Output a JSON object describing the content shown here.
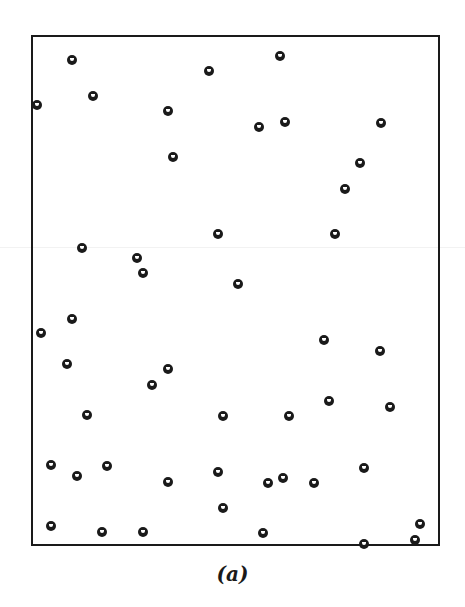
{
  "figure": {
    "caption": "(a)",
    "frame": {
      "left": 31,
      "top": 35,
      "right": 438,
      "bottom": 544
    },
    "point_style": "black ring with white crescent"
  },
  "chart_data": {
    "type": "scatter",
    "title": "",
    "caption": "(a)",
    "xlabel": "",
    "ylabel": "",
    "grid": false,
    "units": "pixel coordinates (image space, y down)",
    "points": [
      {
        "x": 72,
        "y": 60
      },
      {
        "x": 209,
        "y": 71
      },
      {
        "x": 280,
        "y": 56
      },
      {
        "x": 37,
        "y": 105
      },
      {
        "x": 93,
        "y": 96
      },
      {
        "x": 168,
        "y": 111
      },
      {
        "x": 259,
        "y": 127
      },
      {
        "x": 285,
        "y": 122
      },
      {
        "x": 381,
        "y": 123
      },
      {
        "x": 173,
        "y": 157
      },
      {
        "x": 360,
        "y": 163
      },
      {
        "x": 345,
        "y": 189
      },
      {
        "x": 82,
        "y": 248
      },
      {
        "x": 218,
        "y": 234
      },
      {
        "x": 335,
        "y": 234
      },
      {
        "x": 137,
        "y": 258
      },
      {
        "x": 143,
        "y": 273
      },
      {
        "x": 238,
        "y": 284
      },
      {
        "x": 41,
        "y": 333
      },
      {
        "x": 72,
        "y": 319
      },
      {
        "x": 324,
        "y": 340
      },
      {
        "x": 380,
        "y": 351
      },
      {
        "x": 67,
        "y": 364
      },
      {
        "x": 168,
        "y": 369
      },
      {
        "x": 152,
        "y": 385
      },
      {
        "x": 87,
        "y": 415
      },
      {
        "x": 223,
        "y": 416
      },
      {
        "x": 289,
        "y": 416
      },
      {
        "x": 329,
        "y": 401
      },
      {
        "x": 390,
        "y": 407
      },
      {
        "x": 51,
        "y": 465
      },
      {
        "x": 77,
        "y": 476
      },
      {
        "x": 107,
        "y": 466
      },
      {
        "x": 168,
        "y": 482
      },
      {
        "x": 218,
        "y": 472
      },
      {
        "x": 268,
        "y": 483
      },
      {
        "x": 283,
        "y": 478
      },
      {
        "x": 314,
        "y": 483
      },
      {
        "x": 364,
        "y": 468
      },
      {
        "x": 223,
        "y": 508
      },
      {
        "x": 51,
        "y": 526
      },
      {
        "x": 102,
        "y": 532
      },
      {
        "x": 143,
        "y": 532
      },
      {
        "x": 263,
        "y": 533
      },
      {
        "x": 420,
        "y": 524
      },
      {
        "x": 415,
        "y": 540
      },
      {
        "x": 364,
        "y": 544
      }
    ]
  }
}
